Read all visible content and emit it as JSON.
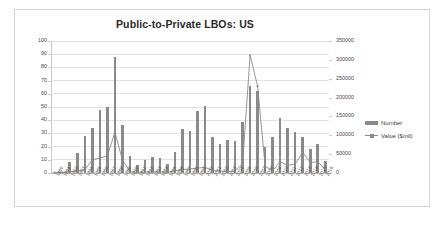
{
  "chart_data": {
    "type": "bar",
    "title": "Public-to-Private LBOs: US",
    "xlabel": "",
    "ylabel": "",
    "grid": true,
    "legend_position": "right",
    "categories": [
      "1980",
      "1981",
      "1982",
      "1983",
      "1984",
      "1985",
      "1986",
      "1987",
      "1988",
      "1989",
      "1990",
      "1991",
      "1992",
      "1993",
      "1994",
      "1995",
      "1996",
      "1997",
      "1998",
      "1999",
      "2000",
      "2001",
      "2002",
      "2003",
      "2004",
      "2005",
      "2006",
      "2007",
      "2008",
      "2009",
      "2010",
      "2011",
      "2012",
      "2013",
      "2014",
      "2015",
      "2016"
    ],
    "series": [
      {
        "name": "Number",
        "type": "bar",
        "axis": "left",
        "values": [
          1,
          1,
          8,
          15,
          28,
          34,
          48,
          50,
          88,
          36,
          13,
          6,
          10,
          12,
          11,
          7,
          16,
          33,
          32,
          47,
          51,
          27,
          22,
          25,
          24,
          39,
          66,
          62,
          20,
          27,
          42,
          34,
          31,
          27,
          18,
          22,
          9
        ]
      },
      {
        "name": "Value ($mil)",
        "type": "line",
        "axis": "right",
        "values": [
          1000,
          1500,
          3000,
          6000,
          8000,
          35000,
          40000,
          45000,
          108000,
          35000,
          4000,
          1500,
          2500,
          2500,
          3000,
          2000,
          6000,
          9000,
          11000,
          13000,
          15000,
          7000,
          5000,
          4000,
          5000,
          25000,
          312000,
          230000,
          18000,
          6000,
          30000,
          20000,
          24000,
          55000,
          28000,
          30000,
          10000
        ]
      }
    ],
    "left_axis": {
      "min": 0,
      "max": 100,
      "step": 10,
      "ticks": [
        "0",
        "10",
        "20",
        "30",
        "40",
        "50",
        "60",
        "70",
        "80",
        "90",
        "100"
      ]
    },
    "right_axis": {
      "min": 0,
      "max": 350000,
      "step": 50000,
      "ticks": [
        "0",
        "50000",
        "100000",
        "150000",
        "200000",
        "250000",
        "300000",
        "350000"
      ]
    },
    "legend": [
      {
        "label": "Number",
        "marker": "bar-swatch"
      },
      {
        "label": "Value ($mil)",
        "marker": "line-marker-swatch"
      }
    ],
    "colors": {
      "bar": "#8a8a8a",
      "line": "#8a8a8a",
      "grid": "#e2e2e2",
      "axis_text": "#4a4a4a",
      "title_text": "#2a2a2a",
      "frame": "#d6d6d6"
    }
  }
}
